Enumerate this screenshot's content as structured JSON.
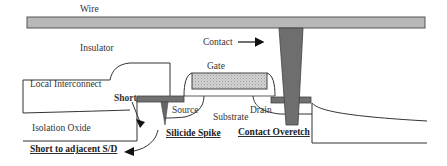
{
  "diagram": {
    "type": "semiconductor-cross-section",
    "labels": {
      "wire": "Wire",
      "insulator": "Insulator",
      "contact": "Contact",
      "gate": "Gate",
      "local_interconnect": "Local Interconnect",
      "short": "Short",
      "source": "Source",
      "drain": "Drain",
      "substrate": "Substrate",
      "isolation_oxide": "Isolation Oxide",
      "silicide_spike": "Silicide Spike",
      "contact_overetch": "Contact Overetch",
      "short_to_adjacent": "Short to adjacent S/D"
    },
    "colors": {
      "wire_fill": "#b8b8b8",
      "contact_fill": "#6e6e6e",
      "silicide_fill": "#707070",
      "gate_fill": "#cfcfcf",
      "line": "#333333",
      "background": "#ffffff"
    },
    "defects": [
      {
        "name": "Short",
        "emphasis": "bold-underline"
      },
      {
        "name": "Silicide Spike",
        "emphasis": "bold-underline"
      },
      {
        "name": "Contact Overetch",
        "emphasis": "bold-underline"
      },
      {
        "name": "Short to adjacent S/D",
        "emphasis": "bold-underline"
      }
    ]
  }
}
